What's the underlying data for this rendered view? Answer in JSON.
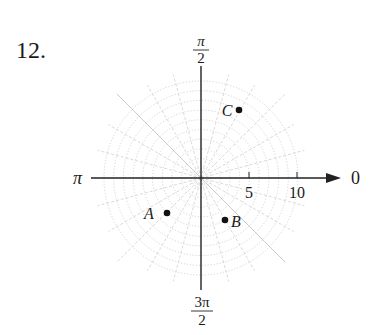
{
  "problem": {
    "number": "12."
  },
  "axes": {
    "angle_labels": {
      "zero": "0",
      "pi_over_2": {
        "numerator": "π",
        "denominator": "2"
      },
      "pi": "π",
      "three_pi_over_2": {
        "numerator": "3π",
        "denominator": "2"
      }
    },
    "radial_ticks": [
      {
        "value": 5,
        "label": "5"
      },
      {
        "value": 10,
        "label": "10"
      }
    ]
  },
  "grid": {
    "type": "polar",
    "circles": [
      1,
      2,
      3,
      4,
      5,
      6,
      7,
      8,
      9,
      10
    ],
    "spoke_step_degrees": 15
  },
  "points": [
    {
      "label": "A",
      "r": 5,
      "theta": "5π/4",
      "theta_deg": 225,
      "label_side": "left"
    },
    {
      "label": "B",
      "r": 5,
      "theta": "5π/3",
      "theta_deg": 300,
      "label_side": "right"
    },
    {
      "label": "C",
      "r": 8,
      "theta": "π/3",
      "theta_deg": 60,
      "label_side": "left"
    }
  ]
}
